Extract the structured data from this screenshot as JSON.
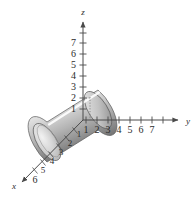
{
  "figure": {
    "background_color": "#ffffff",
    "axis_color": "#4a4a4a",
    "tick_color": "#4a4a4a",
    "label_color": "#2b2b2b"
  },
  "axes": {
    "z": {
      "name": "z",
      "label": "z",
      "ticks": [
        "1",
        "2",
        "3",
        "4",
        "5",
        "6",
        "7"
      ],
      "direction": "up",
      "arrow": true
    },
    "y": {
      "name": "y",
      "label": "y",
      "ticks": [
        "1",
        "2",
        "3",
        "4",
        "5",
        "6",
        "7"
      ],
      "direction": "right",
      "arrow": true
    },
    "x": {
      "name": "x",
      "label": "x",
      "ticks": [
        "1",
        "2",
        "3",
        "4",
        "5",
        "6"
      ],
      "direction": "down-left",
      "arrow": true
    }
  },
  "solid": {
    "name": "cylinder",
    "shading": "grayscale-gradient",
    "highlight_color": "#fdfdfd",
    "midtone_color": "#b9b9b9",
    "shadow_color": "#4f4f4f",
    "outline_color": "#555555",
    "cap_color": "#cfcfcf",
    "axis_of_revolution": "x",
    "radius_value": "1",
    "top_height_value": "2"
  },
  "guides": {
    "style": "dotted",
    "color": "#777777",
    "count": "2"
  }
}
